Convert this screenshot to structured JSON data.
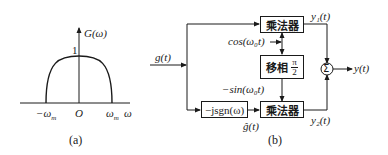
{
  "panel_a": {
    "y_axis_label": "G(ω)",
    "peak_label": "1",
    "origin_label": "O",
    "neg_cutoff_label": "−ω",
    "neg_cutoff_sub": "m",
    "pos_cutoff_label": "ω",
    "pos_cutoff_sub": "m",
    "x_axis_label": "ω",
    "caption": "(a)"
  },
  "panel_b": {
    "input_label": "g(t)",
    "multiplier_top": "乘法器",
    "phase_shifter": "移相",
    "phase_num": "π",
    "phase_den": "2",
    "hilbert_block": "−jsgn(ω)",
    "multiplier_bottom": "乘法器",
    "cos_label": "cos(ω₀t)",
    "sin_label": "−sin(ω₀t)",
    "hilbert_output_label": "ĝ(t)",
    "y1_label": "y₁(t)",
    "y2_label": "y₂(t)",
    "sum_symbol": "Σ",
    "output_label": "y(t)",
    "caption": "(b)"
  }
}
